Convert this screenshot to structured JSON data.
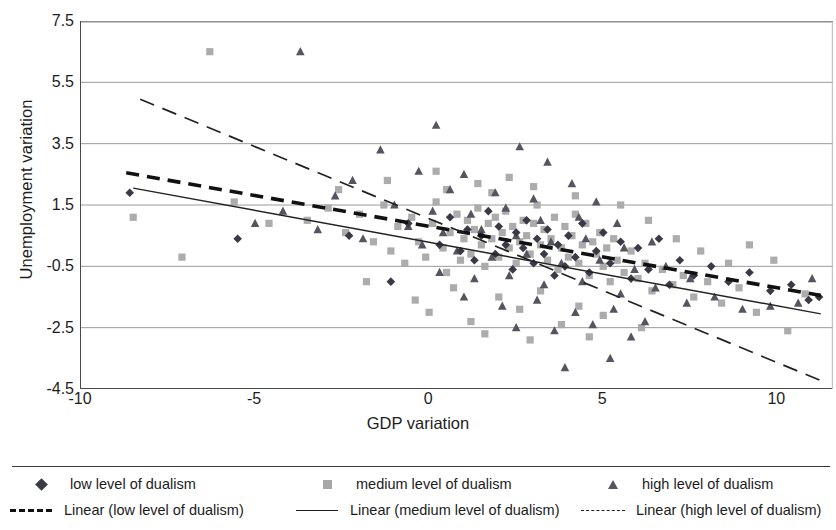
{
  "chart_data": {
    "type": "scatter",
    "title": "",
    "xlabel": "GDP variation",
    "ylabel": "Unemployment variation",
    "xlim": [
      -10,
      11.6
    ],
    "ylim": [
      -4.5,
      7.5
    ],
    "xticks": [
      "-10",
      "-5",
      "0",
      "5",
      "10"
    ],
    "xtick_values": [
      -10,
      -5,
      0,
      5,
      10
    ],
    "yticks": [
      "7.5",
      "5.5",
      "3.5",
      "1.5",
      "-0.5",
      "-2.5",
      "-4.5"
    ],
    "ytick_values": [
      7.5,
      5.5,
      3.5,
      1.5,
      -0.5,
      -2.5,
      -4.5
    ],
    "grid": "horizontal",
    "legend_position": "bottom",
    "series": [
      {
        "name": "low level of dualism",
        "marker": "diamond",
        "color": "#3a3a46",
        "points": [
          [
            -8.6,
            1.9
          ],
          [
            -5.5,
            0.4
          ],
          [
            -2.3,
            0.5
          ],
          [
            -1.1,
            -1.0
          ],
          [
            -0.6,
            0.9
          ],
          [
            0.3,
            0.2
          ],
          [
            0.6,
            1.1
          ],
          [
            0.9,
            0.0
          ],
          [
            1.1,
            0.7
          ],
          [
            1.3,
            -0.3
          ],
          [
            1.5,
            0.5
          ],
          [
            1.7,
            1.3
          ],
          [
            1.9,
            -0.1
          ],
          [
            2.0,
            0.8
          ],
          [
            2.2,
            0.2
          ],
          [
            2.4,
            -0.6
          ],
          [
            2.5,
            0.6
          ],
          [
            2.7,
            0.1
          ],
          [
            2.8,
            1.0
          ],
          [
            3.0,
            -0.4
          ],
          [
            3.1,
            0.4
          ],
          [
            3.3,
            -0.1
          ],
          [
            3.4,
            0.7
          ],
          [
            3.6,
            -0.8
          ],
          [
            3.7,
            0.2
          ],
          [
            3.9,
            -0.5
          ],
          [
            4.0,
            0.5
          ],
          [
            4.2,
            -0.2
          ],
          [
            4.4,
            0.9
          ],
          [
            4.6,
            -0.7
          ],
          [
            4.8,
            0.0
          ],
          [
            5.0,
            0.6
          ],
          [
            5.2,
            -0.4
          ],
          [
            5.5,
            0.3
          ],
          [
            5.8,
            -0.9
          ],
          [
            6.0,
            0.1
          ],
          [
            6.3,
            -0.6
          ],
          [
            6.6,
            0.4
          ],
          [
            6.9,
            -1.1
          ],
          [
            7.2,
            -0.3
          ],
          [
            7.6,
            -0.8
          ],
          [
            8.1,
            -0.5
          ],
          [
            8.6,
            -1.0
          ],
          [
            9.2,
            -0.7
          ],
          [
            9.8,
            -1.3
          ],
          [
            10.4,
            -1.1
          ],
          [
            10.9,
            -1.6
          ],
          [
            11.2,
            -1.5
          ]
        ]
      },
      {
        "name": "medium level of dualism",
        "marker": "square",
        "color": "#a8a8a8",
        "points": [
          [
            -6.3,
            6.5
          ],
          [
            -8.5,
            1.1
          ],
          [
            -7.1,
            -0.2
          ],
          [
            -5.6,
            1.6
          ],
          [
            -4.6,
            0.9
          ],
          [
            -3.5,
            1.0
          ],
          [
            -2.9,
            1.4
          ],
          [
            -2.4,
            0.6
          ],
          [
            -2.0,
            1.2
          ],
          [
            -1.6,
            0.3
          ],
          [
            -1.3,
            1.5
          ],
          [
            -1.1,
            0.0
          ],
          [
            -0.9,
            0.8
          ],
          [
            -0.7,
            -0.4
          ],
          [
            -0.5,
            1.1
          ],
          [
            -0.3,
            0.3
          ],
          [
            -0.1,
            -0.2
          ],
          [
            0.1,
            0.9
          ],
          [
            0.2,
            1.6
          ],
          [
            0.4,
            0.1
          ],
          [
            0.5,
            -0.7
          ],
          [
            0.6,
            0.6
          ],
          [
            0.8,
            1.2
          ],
          [
            0.9,
            -0.3
          ],
          [
            1.0,
            0.4
          ],
          [
            1.1,
            1.0
          ],
          [
            1.2,
            -0.1
          ],
          [
            1.3,
            0.7
          ],
          [
            1.4,
            1.4
          ],
          [
            1.5,
            0.2
          ],
          [
            1.6,
            -0.5
          ],
          [
            1.7,
            0.9
          ],
          [
            1.8,
            0.4
          ],
          [
            1.9,
            1.1
          ],
          [
            2.0,
            -0.2
          ],
          [
            2.1,
            0.6
          ],
          [
            2.2,
            1.3
          ],
          [
            2.3,
            0.1
          ],
          [
            2.4,
            0.8
          ],
          [
            2.5,
            -0.4
          ],
          [
            2.6,
            0.3
          ],
          [
            2.7,
            1.0
          ],
          [
            2.8,
            0.5
          ],
          [
            2.9,
            -0.1
          ],
          [
            3.0,
            0.9
          ],
          [
            3.1,
            1.5
          ],
          [
            3.2,
            0.2
          ],
          [
            3.3,
            0.7
          ],
          [
            3.4,
            -0.3
          ],
          [
            3.5,
            0.4
          ],
          [
            3.6,
            1.1
          ],
          [
            3.7,
            -0.6
          ],
          [
            3.8,
            0.1
          ],
          [
            3.9,
            0.8
          ],
          [
            4.0,
            -0.2
          ],
          [
            4.1,
            0.5
          ],
          [
            4.2,
            1.2
          ],
          [
            4.3,
            -0.4
          ],
          [
            4.4,
            0.2
          ],
          [
            4.5,
            0.9
          ],
          [
            4.6,
            -0.8
          ],
          [
            4.7,
            0.3
          ],
          [
            4.8,
            -0.1
          ],
          [
            4.9,
            0.6
          ],
          [
            5.0,
            -0.5
          ],
          [
            5.1,
            0.1
          ],
          [
            5.2,
            -1.0
          ],
          [
            5.3,
            0.4
          ],
          [
            5.4,
            -0.3
          ],
          [
            5.6,
            -0.7
          ],
          [
            5.8,
            0.0
          ],
          [
            6.0,
            -0.9
          ],
          [
            6.2,
            -0.4
          ],
          [
            6.4,
            -1.3
          ],
          [
            6.7,
            -0.6
          ],
          [
            7.0,
            -1.1
          ],
          [
            7.3,
            -0.8
          ],
          [
            7.6,
            -1.5
          ],
          [
            8.0,
            -1.0
          ],
          [
            8.4,
            -1.7
          ],
          [
            8.9,
            -1.2
          ],
          [
            9.4,
            -2.0
          ],
          [
            9.9,
            -0.3
          ],
          [
            10.3,
            -2.6
          ],
          [
            10.8,
            -1.4
          ],
          [
            0.0,
            -2.0
          ],
          [
            1.2,
            -2.3
          ],
          [
            2.6,
            -1.9
          ],
          [
            3.8,
            -2.4
          ],
          [
            5.0,
            -2.1
          ],
          [
            -1.8,
            -1.0
          ],
          [
            -0.4,
            -1.6
          ],
          [
            0.7,
            -1.2
          ],
          [
            2.0,
            -1.5
          ],
          [
            3.2,
            -1.3
          ],
          [
            4.3,
            -1.8
          ],
          [
            1.6,
            -2.7
          ],
          [
            2.9,
            -2.9
          ],
          [
            4.6,
            -2.8
          ],
          [
            6.1,
            -2.5
          ],
          [
            0.5,
            2.0
          ],
          [
            1.8,
            1.9
          ],
          [
            3.0,
            2.1
          ],
          [
            4.2,
            1.8
          ],
          [
            2.3,
            2.4
          ],
          [
            -2.6,
            2.0
          ],
          [
            -1.2,
            2.3
          ],
          [
            0.2,
            2.6
          ],
          [
            1.4,
            2.2
          ],
          [
            5.5,
            1.5
          ],
          [
            6.3,
            1.0
          ],
          [
            7.1,
            0.4
          ],
          [
            7.8,
            0.0
          ],
          [
            8.6,
            -0.4
          ],
          [
            9.2,
            0.2
          ]
        ]
      },
      {
        "name": "high level of dualism",
        "marker": "triangle",
        "color": "#555560",
        "points": [
          [
            -3.7,
            6.5
          ],
          [
            0.2,
            4.1
          ],
          [
            -1.4,
            3.3
          ],
          [
            2.6,
            3.4
          ],
          [
            3.4,
            2.9
          ],
          [
            -0.3,
            2.6
          ],
          [
            1.0,
            2.5
          ],
          [
            4.1,
            2.2
          ],
          [
            -2.2,
            2.3
          ],
          [
            0.6,
            2.0
          ],
          [
            1.9,
            1.9
          ],
          [
            3.0,
            1.7
          ],
          [
            4.8,
            1.6
          ],
          [
            -1.0,
            1.5
          ],
          [
            0.1,
            1.3
          ],
          [
            1.2,
            1.2
          ],
          [
            2.2,
            1.4
          ],
          [
            3.2,
            1.0
          ],
          [
            4.3,
            1.1
          ],
          [
            5.4,
            0.9
          ],
          [
            -0.6,
            0.8
          ],
          [
            0.4,
            0.6
          ],
          [
            1.5,
            0.7
          ],
          [
            2.5,
            0.5
          ],
          [
            3.5,
            0.3
          ],
          [
            4.5,
            0.4
          ],
          [
            5.6,
            0.1
          ],
          [
            6.4,
            0.3
          ],
          [
            -0.2,
            0.2
          ],
          [
            0.8,
            0.0
          ],
          [
            1.8,
            -0.2
          ],
          [
            2.8,
            -0.1
          ],
          [
            3.8,
            -0.4
          ],
          [
            4.9,
            -0.3
          ],
          [
            5.9,
            -0.6
          ],
          [
            6.8,
            -0.5
          ],
          [
            7.5,
            -0.9
          ],
          [
            0.3,
            -0.7
          ],
          [
            1.3,
            -0.9
          ],
          [
            2.3,
            -0.8
          ],
          [
            3.3,
            -1.1
          ],
          [
            4.4,
            -1.0
          ],
          [
            5.5,
            -1.4
          ],
          [
            6.5,
            -1.2
          ],
          [
            7.4,
            -1.7
          ],
          [
            1.0,
            -1.5
          ],
          [
            2.1,
            -1.8
          ],
          [
            3.1,
            -1.6
          ],
          [
            4.2,
            -2.0
          ],
          [
            5.3,
            -1.9
          ],
          [
            6.2,
            -2.3
          ],
          [
            2.5,
            -2.5
          ],
          [
            3.6,
            -2.6
          ],
          [
            4.7,
            -2.4
          ],
          [
            5.8,
            -2.8
          ],
          [
            3.9,
            -3.8
          ],
          [
            5.2,
            -3.5
          ],
          [
            8.2,
            -1.5
          ],
          [
            9.0,
            -1.9
          ],
          [
            9.8,
            -1.8
          ],
          [
            10.6,
            -1.7
          ],
          [
            11.0,
            -0.9
          ],
          [
            -5.0,
            0.9
          ],
          [
            -4.2,
            1.3
          ],
          [
            -3.2,
            0.7
          ],
          [
            -2.7,
            1.8
          ],
          [
            -1.9,
            0.4
          ]
        ]
      }
    ],
    "trendlines": [
      {
        "name": "Linear (low level of dualism)",
        "style": "thick-dashed",
        "color": "#111111",
        "x0": -8.7,
        "y0": 2.55,
        "x1": 11.25,
        "y1": -1.45
      },
      {
        "name": "Linear (medium level of dualism)",
        "style": "solid",
        "color": "#222222",
        "x0": -8.5,
        "y0": 2.05,
        "x1": 11.25,
        "y1": -2.05
      },
      {
        "name": "Linear (high level of dualism)",
        "style": "long-dashed",
        "color": "#222222",
        "x0": -8.3,
        "y0": 4.95,
        "x1": 11.3,
        "y1": -4.25
      }
    ]
  },
  "legend": {
    "markers": [
      {
        "key": "diamond-marker",
        "label": "low level of dualism"
      },
      {
        "key": "square-marker",
        "label": "medium level of dualism"
      },
      {
        "key": "triangle-marker",
        "label": "high level of dualism"
      }
    ],
    "lines": [
      {
        "key": "thick-dashed-line",
        "label": "Linear (low level of dualism)"
      },
      {
        "key": "solid-line",
        "label": "Linear (medium level of dualism)"
      },
      {
        "key": "long-dashed-line",
        "label": "Linear (high level of dualism)"
      }
    ]
  }
}
